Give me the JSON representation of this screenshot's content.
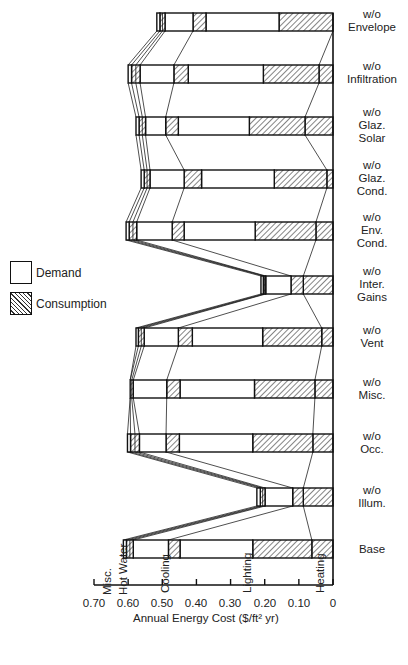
{
  "legend": [
    {
      "label": "Demand",
      "style": "open"
    },
    {
      "label": "Consumption",
      "style": "hatched"
    }
  ],
  "axis": {
    "title": "Annual Energy Cost ($/ft² yr)",
    "ticks": [
      "0.70",
      "0.60",
      "0.50",
      "0.40",
      "0.30",
      "0.20",
      "0.10",
      "0"
    ]
  },
  "end_use_labels": [
    "Misc.",
    "Hot Water",
    "Cooling",
    "Lighting",
    "Heating"
  ],
  "row_labels": [
    "w/o\nEnvelope",
    "w/o\nInfiltration",
    "w/o\nGlaz.\nSolar",
    "w/o\nGlaz.\nCond.",
    "w/o\nEnv.\nCond.",
    "w/o\nInter.\nGains",
    "w/o\nVent",
    "w/o\nMisc.",
    "w/o\nOcc.",
    "w/o\nIllum.",
    "Base"
  ],
  "chart_data": {
    "type": "bar",
    "orientation": "horizontal-stacked-reversed",
    "title": "",
    "xlabel": "Annual Energy Cost ($/ft² yr)",
    "ylabel": "",
    "xlim": [
      0.7,
      0
    ],
    "xticks": [
      0.7,
      0.6,
      0.5,
      0.4,
      0.3,
      0.2,
      0.1,
      0
    ],
    "grid": false,
    "legend_position": "left",
    "boundary_keys": [
      "heating",
      "lighting_consumption",
      "lighting_demand",
      "cooling_consumption",
      "cooling_demand",
      "hot_water",
      "misc_total"
    ],
    "segment_order": [
      {
        "name": "Heating consumption",
        "style": "hatched"
      },
      {
        "name": "Lighting consumption",
        "style": "hatched"
      },
      {
        "name": "Lighting demand",
        "style": "open"
      },
      {
        "name": "Cooling consumption",
        "style": "hatched"
      },
      {
        "name": "Cooling demand",
        "style": "open"
      },
      {
        "name": "Hot water",
        "style": "hatched"
      },
      {
        "name": "Misc.",
        "style": "open"
      }
    ],
    "categories": [
      "w/o Envelope",
      "w/o Infiltration",
      "w/o Glaz. Solar",
      "w/o Glaz. Cond.",
      "w/o Env. Cond.",
      "w/o Inter. Gains",
      "w/o Vent",
      "w/o Misc.",
      "w/o Occ.",
      "w/o Illum.",
      "Base"
    ],
    "cumulative_boundaries": [
      [
        0.0,
        0.158,
        0.372,
        0.41,
        0.492,
        0.507,
        0.516
      ],
      [
        0.041,
        0.204,
        0.424,
        0.466,
        0.565,
        0.59,
        0.6
      ],
      [
        0.082,
        0.245,
        0.453,
        0.49,
        0.549,
        0.568,
        0.577
      ],
      [
        0.018,
        0.172,
        0.385,
        0.436,
        0.536,
        0.553,
        0.562
      ],
      [
        0.05,
        0.228,
        0.436,
        0.471,
        0.575,
        0.597,
        0.606
      ],
      [
        0.087,
        0.087,
        0.087,
        0.123,
        0.197,
        0.204,
        0.211
      ],
      [
        0.033,
        0.206,
        0.412,
        0.453,
        0.553,
        0.57,
        0.577
      ],
      [
        0.053,
        0.23,
        0.448,
        0.487,
        0.585,
        0.594,
        0.594
      ],
      [
        0.059,
        0.235,
        0.45,
        0.489,
        0.567,
        0.593,
        0.602
      ],
      [
        0.087,
        0.087,
        0.087,
        0.118,
        0.199,
        0.213,
        0.223
      ],
      [
        0.062,
        0.235,
        0.448,
        0.482,
        0.585,
        0.605,
        0.614
      ]
    ],
    "connector_boundary_indices": [
      0,
      3,
      4,
      5,
      6
    ]
  }
}
